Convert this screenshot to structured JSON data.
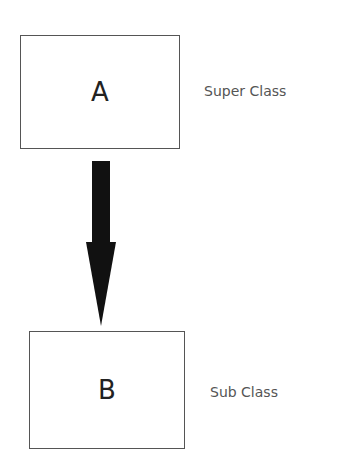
{
  "diagram": {
    "nodes": [
      {
        "id": "A",
        "label": "A",
        "role_label": "Super Class"
      },
      {
        "id": "B",
        "label": "B",
        "role_label": "Sub Class"
      }
    ],
    "edges": [
      {
        "from": "A",
        "to": "B",
        "style": "thick-arrow",
        "color": "#111111"
      }
    ]
  }
}
